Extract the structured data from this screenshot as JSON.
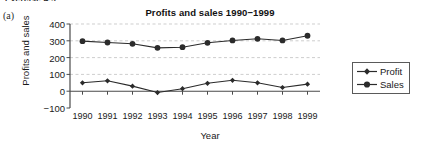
{
  "page": {
    "cropped_heading": "Exercise 4.5",
    "part_label": "(a)"
  },
  "legend": {
    "position": "right",
    "entries": [
      {
        "label": "Profit",
        "marker": "diamond"
      },
      {
        "label": "Sales",
        "marker": "circle"
      }
    ]
  },
  "axes": {
    "ylabel": "Profits and sales",
    "xlabel": "Year",
    "yticks": [
      "400",
      "300",
      "200",
      "100",
      "0",
      "−100"
    ],
    "xticks": [
      "1990",
      "1991",
      "1992",
      "1993",
      "1994",
      "1995",
      "1996",
      "1997",
      "1998",
      "1999"
    ]
  },
  "colors": {
    "line": "#2b2b2b",
    "grid": "#b9b9b9",
    "axis": "#4a4a4a",
    "text": "#1a1a1a",
    "background": "#ffffff"
  },
  "chart_data": {
    "type": "line",
    "title": "Profits and sales 1990−1999",
    "xlabel": "Year",
    "ylabel": "Profits and sales",
    "categories": [
      1990,
      1991,
      1992,
      1993,
      1994,
      1995,
      1996,
      1997,
      1998,
      1999
    ],
    "series": [
      {
        "name": "Profit",
        "marker": "diamond",
        "values": [
          50,
          62,
          30,
          -8,
          15,
          47,
          65,
          50,
          22,
          42
        ]
      },
      {
        "name": "Sales",
        "marker": "circle",
        "values": [
          298,
          290,
          282,
          258,
          262,
          288,
          302,
          312,
          302,
          330
        ]
      }
    ],
    "ylim": [
      -100,
      400
    ],
    "ytick_values": [
      400,
      300,
      200,
      100,
      0,
      -100
    ],
    "grid": "horizontal-dashed",
    "legend_position": "right"
  }
}
